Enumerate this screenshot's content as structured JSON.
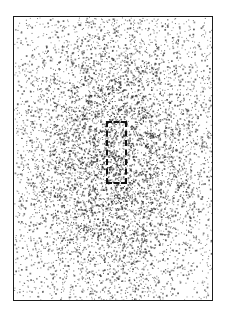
{
  "figure": {
    "title": "",
    "caption": "",
    "background_color": "#ffffff",
    "width_px": 231,
    "height_px": 320
  },
  "frame": {
    "name": "plot-frame",
    "left_px": 13,
    "top_px": 16,
    "width_px": 200,
    "height_px": 285,
    "border_color": "#1a1a1a",
    "border_width_px": 1.4,
    "fill_color": "#ffffff"
  },
  "roi": {
    "label": "",
    "left_px": 92,
    "top_px": 104,
    "width_px": 21,
    "height_px": 63,
    "stroke_color": "#111111",
    "stroke_width_px": 2.2,
    "dash_length_px": 9,
    "dash_gap_px": 5,
    "style": "dashed"
  },
  "chart_data": {
    "type": "scatter",
    "title": "",
    "subtitle": "",
    "xlabel": "",
    "ylabel": "",
    "xlim": [
      0,
      200
    ],
    "ylim": [
      0,
      285
    ],
    "grid": false,
    "legend": null,
    "annotations": [
      {
        "kind": "dashed-rectangle",
        "label": "region of interest",
        "x": 92,
        "y": 104,
        "width": 21,
        "height": 63
      }
    ],
    "point_style": {
      "marker": "square",
      "size_px": 1,
      "color": "#2b2b2b",
      "min_alpha": 0.35,
      "max_alpha": 0.95
    },
    "total_points": 7200,
    "density_model": {
      "kind": "anisotropic-gaussian-radial",
      "center_x": 100,
      "center_y": 140,
      "sigma_x": 62,
      "sigma_y": 92,
      "floor": 0.06,
      "seed": 20240517
    },
    "density_samples": [
      {
        "region": "centre",
        "x": 100,
        "y": 140,
        "relative_density": 1.0
      },
      {
        "region": "upper-centre",
        "x": 100,
        "y": 75,
        "relative_density": 0.82
      },
      {
        "region": "lower-centre",
        "x": 100,
        "y": 210,
        "relative_density": 0.74
      },
      {
        "region": "left-mid",
        "x": 35,
        "y": 140,
        "relative_density": 0.55
      },
      {
        "region": "right-mid",
        "x": 165,
        "y": 140,
        "relative_density": 0.5
      },
      {
        "region": "top-left-corner",
        "x": 18,
        "y": 22,
        "relative_density": 0.1
      },
      {
        "region": "top-right-corner",
        "x": 182,
        "y": 22,
        "relative_density": 0.1
      },
      {
        "region": "bottom-left-corner",
        "x": 18,
        "y": 262,
        "relative_density": 0.09
      },
      {
        "region": "bottom-right-corner",
        "x": 182,
        "y": 262,
        "relative_density": 0.08
      }
    ]
  }
}
